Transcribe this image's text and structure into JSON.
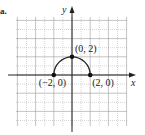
{
  "item_marker": "a.",
  "chart_data": {
    "type": "line",
    "title": "",
    "xlabel": "x",
    "ylabel": "y",
    "xlim": [
      -6,
      6
    ],
    "ylim": [
      -6,
      6
    ],
    "grid": true,
    "curve": "upper semicircle x^2 + y^2 = 4, y >= 0",
    "points": [
      {
        "x": -2,
        "y": 0,
        "label": "(−2, 0)"
      },
      {
        "x": 0,
        "y": 2,
        "label": "(0, 2)"
      },
      {
        "x": 2,
        "y": 0,
        "label": "(2, 0)"
      }
    ]
  },
  "colors": {
    "axis": "#222222",
    "curve": "#222222",
    "grid_major": "#9a9a9a",
    "grid_minor": "#b8b8b8"
  }
}
